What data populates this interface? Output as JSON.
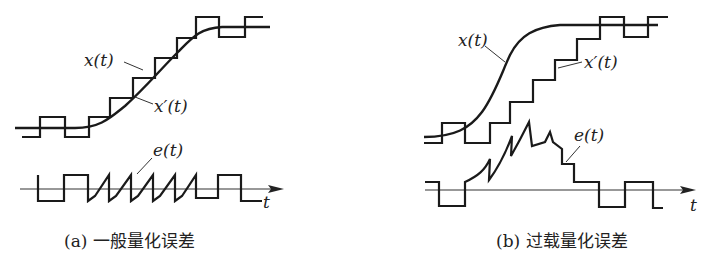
{
  "figure": {
    "panels": [
      {
        "id": "a",
        "caption": "(a) 一般量化误差",
        "labels": {
          "signal": "x(t)",
          "staircase": "x′(t)",
          "error": "e(t)",
          "time_axis": "t"
        }
      },
      {
        "id": "b",
        "caption": "(b) 过载量化误差",
        "labels": {
          "signal": "x(t)",
          "staircase": "x′(t)",
          "error": "e(t)",
          "time_axis": "t"
        }
      }
    ]
  },
  "colors": {
    "line": "#1a1a1a",
    "background": "#ffffff"
  }
}
